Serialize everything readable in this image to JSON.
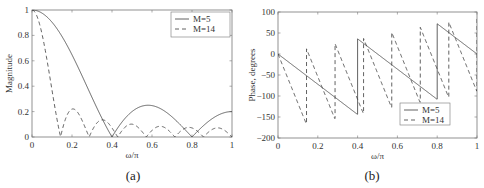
{
  "chart_data": [
    {
      "type": "line",
      "caption": "(a)",
      "title": "",
      "xlabel": "ω/π",
      "ylabel": "Magnitude",
      "xlim": [
        0,
        1
      ],
      "ylim": [
        0,
        1
      ],
      "xticks": [
        0,
        0.2,
        0.4,
        0.6,
        0.8,
        1
      ],
      "xtick_labels": [
        "0",
        "0.2",
        "0.4",
        "0.6",
        "0.8",
        "1"
      ],
      "yticks": [
        0,
        0.2,
        0.4,
        0.6,
        0.8,
        1
      ],
      "ytick_labels": [
        "0",
        "0.2",
        "0.4",
        "0.6",
        "0.8",
        "1"
      ],
      "grid": false,
      "legend_position": "upper right",
      "series": [
        {
          "name": "M=5",
          "style": "solid",
          "formula": "|sin(Mω/2)/(M sin(ω/2))|",
          "M": 5,
          "x": [
            0,
            0.1,
            0.2,
            0.3,
            0.4,
            0.5,
            0.58,
            0.7,
            0.8,
            0.9,
            1.0
          ],
          "values": [
            1.0,
            0.9,
            0.65,
            0.31,
            0.0,
            0.2,
            0.25,
            0.16,
            0.0,
            0.16,
            0.2
          ]
        },
        {
          "name": "M=14",
          "style": "dashed",
          "formula": "|sin(Mω/2)/(M sin(ω/2))|",
          "M": 14,
          "x": [
            0,
            0.05,
            0.1,
            0.143,
            0.21,
            0.286,
            0.36,
            0.429,
            0.5,
            0.571,
            0.64,
            0.714,
            0.79,
            0.857,
            0.93,
            1.0
          ],
          "values": [
            1.0,
            0.82,
            0.4,
            0.0,
            0.22,
            0.0,
            0.13,
            0.0,
            0.09,
            0.0,
            0.08,
            0.0,
            0.07,
            0.0,
            0.07,
            0.0
          ]
        }
      ]
    },
    {
      "type": "line",
      "caption": "(b)",
      "title": "",
      "xlabel": "ω/π",
      "ylabel": "Phase, degrees",
      "xlim": [
        0,
        1
      ],
      "ylim": [
        -200,
        100
      ],
      "xticks": [
        0,
        0.2,
        0.4,
        0.6,
        0.8,
        1
      ],
      "xtick_labels": [
        "0",
        "0.2",
        "0.4",
        "0.6",
        "0.8",
        "1"
      ],
      "yticks": [
        -200,
        -150,
        -100,
        -50,
        0,
        50,
        100
      ],
      "ytick_labels": [
        "−200",
        "−150",
        "−100",
        "−50",
        "0",
        "50",
        "100"
      ],
      "grid": false,
      "legend_position": "lower right",
      "series": [
        {
          "name": "M=5",
          "style": "solid",
          "formula": "-(M-1)ω/2 with +180° jumps at magnitude zeros",
          "M": 5,
          "x": [
            0,
            0.4,
            0.4,
            0.8,
            0.8,
            1.0
          ],
          "values": [
            0,
            -144,
            36,
            -108,
            72,
            0
          ]
        },
        {
          "name": "M=14",
          "style": "dashed",
          "formula": "-(M-1)ω/2 with +180° jumps at magnitude zeros",
          "M": 14,
          "x": [
            0,
            0.143,
            0.143,
            0.286,
            0.286,
            0.429,
            0.429,
            0.571,
            0.571,
            0.714,
            0.714,
            0.857,
            0.857,
            1.0
          ],
          "values": [
            0,
            -167,
            13,
            -154,
            26,
            -141,
            39,
            -129,
            51,
            -116,
            64,
            -103,
            77,
            -90
          ]
        }
      ]
    }
  ],
  "captions": {
    "a": "(a)",
    "b": "(b)"
  },
  "legend": {
    "m5": "M=5",
    "m14": "M=14"
  },
  "colors": {
    "line": "#333333",
    "axis": "#666666"
  }
}
